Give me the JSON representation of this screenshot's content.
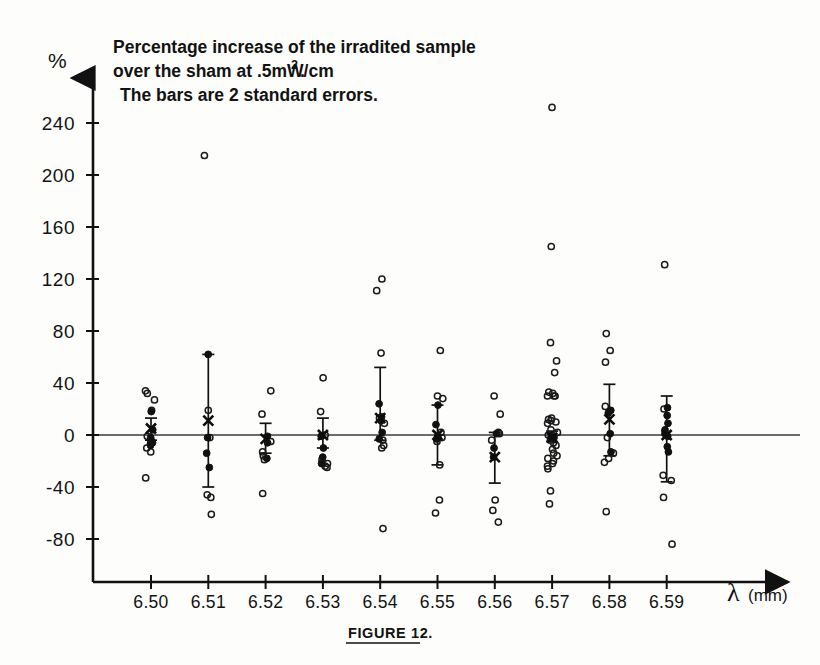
{
  "figure": {
    "caption": "FIGURE 12.",
    "annotation_lines": [
      "Percentage increase of the irradited sample",
      "over the sham at .5mW/cm",
      "The bars are  2 standard errors."
    ],
    "annotation_superscript": "2",
    "annotation_trailing_dot": ".",
    "y_unit_symbol": "%",
    "x_axis_label_symbol": "λ",
    "x_axis_label_units": "(mm)",
    "ink_color": "#111111",
    "paper_color": "#fdfdfc"
  },
  "chart_data": {
    "type": "scatter",
    "xlabel": "λ (mm)",
    "ylabel": "%",
    "ylim": [
      -100,
      255
    ],
    "xlim": [
      6.495,
      6.598
    ],
    "grid": false,
    "legend": "none",
    "yticks": [
      240,
      200,
      160,
      120,
      80,
      40,
      0,
      -40,
      -80
    ],
    "ytick_labels": [
      "240",
      "200",
      "160",
      "120",
      "80",
      "40",
      "0",
      "-40",
      "-80"
    ],
    "xticks": [
      6.5,
      6.51,
      6.52,
      6.53,
      6.54,
      6.55,
      6.56,
      6.57,
      6.58,
      6.59
    ],
    "xtick_labels": [
      "6.50",
      "6.51",
      "6.52",
      "6.53",
      "6.54",
      "6.55",
      "6.56",
      "6.57",
      "6.58",
      "6.59"
    ],
    "zero_reference_line": 0,
    "marker_types": {
      "open": "individual replicate (open circle)",
      "filled": "individual replicate (filled circle)",
      "mean": "group mean (bold X marker)"
    },
    "groups": [
      {
        "x": 6.5,
        "mean": 5,
        "err_low": -4,
        "err_high": 13,
        "open_points": [
          34,
          32,
          27,
          19,
          -1,
          -5,
          -7,
          -10,
          -13,
          -33
        ],
        "filled_points": [
          18,
          4,
          -2,
          -4,
          -6,
          -8
        ]
      },
      {
        "x": 6.51,
        "mean": 11,
        "err_low": -40,
        "err_high": 62,
        "open_points": [
          215,
          19,
          -2,
          -46,
          -48,
          -61
        ],
        "filled_points": [
          62,
          -2,
          -14,
          -25
        ]
      },
      {
        "x": 6.52,
        "mean": -3,
        "err_low": -14,
        "err_high": 9,
        "open_points": [
          34,
          16,
          -5,
          -13,
          -16,
          -19,
          -45
        ],
        "filled_points": [
          -1,
          -6,
          -18
        ]
      },
      {
        "x": 6.53,
        "mean": 0,
        "err_low": -10,
        "err_high": 13,
        "open_points": [
          44,
          18,
          0,
          -19,
          -22,
          -24,
          -25
        ],
        "filled_points": [
          -1,
          -10,
          -17,
          -22
        ]
      },
      {
        "x": 6.54,
        "mean": 13,
        "err_low": -4,
        "err_high": 52,
        "open_points": [
          120,
          111,
          63,
          13,
          9,
          -4,
          -8,
          -10,
          -72
        ],
        "filled_points": [
          24,
          14,
          11,
          2,
          -3
        ]
      },
      {
        "x": 6.55,
        "mean": 0,
        "err_low": -23,
        "err_high": 23,
        "open_points": [
          65,
          30,
          28,
          2,
          -2,
          -5,
          -23,
          -50,
          -60
        ],
        "filled_points": [
          23,
          8,
          -1,
          -3
        ]
      },
      {
        "x": 6.56,
        "mean": -17,
        "err_low": -37,
        "err_high": 2,
        "open_points": [
          30,
          16,
          2,
          1,
          -4,
          -50,
          -58,
          -67
        ],
        "filled_points": [
          1,
          -10,
          -17
        ]
      },
      {
        "x": 6.57,
        "mean": -2,
        "err_low": -5,
        "err_high": 3,
        "open_points": [
          252,
          145,
          71,
          57,
          48,
          33,
          32,
          30,
          30,
          30,
          13,
          12,
          11,
          10,
          9,
          4,
          2,
          0,
          -2,
          -4,
          -6,
          -8,
          -11,
          -14,
          -16,
          -18,
          -20,
          -22,
          -24,
          -26,
          -43,
          -53
        ],
        "filled_points": [
          -1,
          -2
        ]
      },
      {
        "x": 6.58,
        "mean": 12,
        "err_low": -16,
        "err_high": 39,
        "open_points": [
          78,
          65,
          56,
          22,
          -2,
          -14,
          -18,
          -21,
          -59
        ],
        "filled_points": [
          19,
          17,
          1,
          -13
        ]
      },
      {
        "x": 6.59,
        "mean": 0,
        "err_low": -36,
        "err_high": 30,
        "open_points": [
          131,
          20,
          -31,
          -35,
          -48,
          -84
        ],
        "filled_points": [
          21,
          15,
          9,
          4,
          1,
          -1,
          -9,
          -13
        ]
      }
    ]
  }
}
